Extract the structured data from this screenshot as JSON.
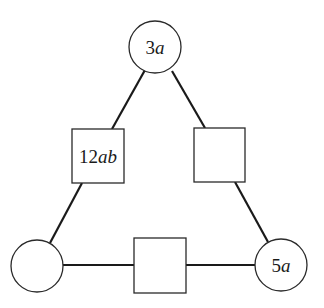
{
  "diagram": {
    "type": "magic-triangle",
    "nodes": {
      "top_circle": {
        "shape": "circle",
        "label_num": "3",
        "label_var": "a"
      },
      "left_square": {
        "shape": "square",
        "label_num": "12",
        "label_var": "ab"
      },
      "right_square": {
        "shape": "square",
        "label_num": "",
        "label_var": ""
      },
      "bottom_left_circle": {
        "shape": "circle",
        "label_num": "",
        "label_var": ""
      },
      "bottom_square": {
        "shape": "square",
        "label_num": "",
        "label_var": ""
      },
      "bottom_right_circle": {
        "shape": "circle",
        "label_num": "5",
        "label_var": "a"
      }
    },
    "edges": [
      [
        "top_circle",
        "left_square"
      ],
      [
        "left_square",
        "bottom_left_circle"
      ],
      [
        "top_circle",
        "right_square"
      ],
      [
        "right_square",
        "bottom_right_circle"
      ],
      [
        "bottom_left_circle",
        "bottom_square"
      ],
      [
        "bottom_square",
        "bottom_right_circle"
      ]
    ]
  }
}
